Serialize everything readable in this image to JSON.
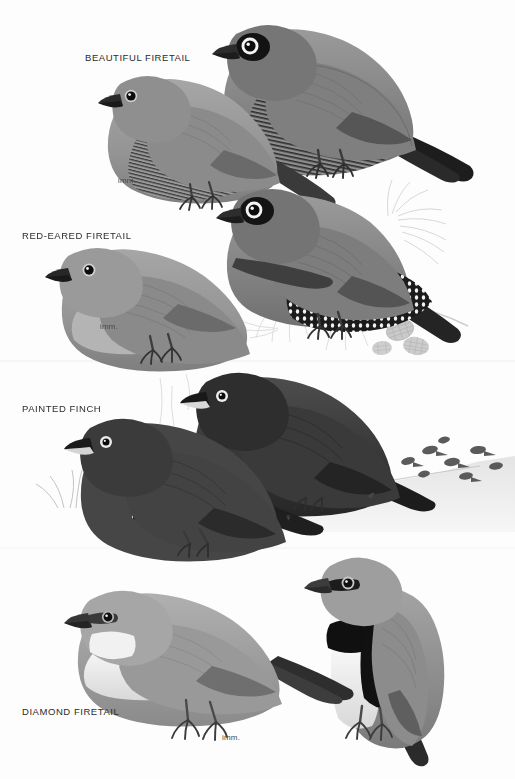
{
  "plate": {
    "title_visible": false,
    "background_color": "#fdfdfd",
    "style": "grayscale field-guide bird plate",
    "width": 515,
    "height": 779
  },
  "panels": [
    {
      "id": "beautiful-firetail",
      "label": "BEAUTIFUL FIRETAIL",
      "label_x": 85,
      "label_y": 52,
      "annotations": [
        {
          "kind": "imm",
          "text": "imm.",
          "x": 118,
          "y": 176
        }
      ],
      "birds": [
        {
          "role": "adult",
          "x": 225,
          "y": 22,
          "scale": 1.0,
          "facing": "left",
          "body_color": "#8d8d8d",
          "head_color": "#7d7d7d",
          "mask_color": "#141414",
          "eyering_color": "#f2f2f2",
          "tail_color": "#1f1f1f",
          "bill_color": "#2b2b2b",
          "barring": true,
          "spots": false
        },
        {
          "role": "immature",
          "x": 85,
          "y": 80,
          "scale": 0.82,
          "facing": "left",
          "body_color": "#9a9a9a",
          "head_color": "#8f8f8f",
          "mask_color": "#2f2f2f",
          "eyering_color": "#cfcfcf",
          "tail_color": "#3a3a3a",
          "bill_color": "#262626",
          "barring": true,
          "spots": false
        }
      ]
    },
    {
      "id": "red-eared-firetail",
      "label": "RED-EARED FIRETAIL",
      "label_x": 22,
      "label_y": 230,
      "annotations": [
        {
          "kind": "imm",
          "text": "imm.",
          "x": 100,
          "y": 322
        }
      ],
      "birds": [
        {
          "role": "adult",
          "x": 228,
          "y": 192,
          "scale": 0.98,
          "facing": "left",
          "body_color": "#8a8a8a",
          "head_color": "#7a7a7a",
          "mask_color": "#151515",
          "eyering_color": "#f4f4f4",
          "tail_color": "#232323",
          "bill_color": "#2b2b2b",
          "barring": true,
          "spots": false
        },
        {
          "role": "immature",
          "x": 60,
          "y": 248,
          "scale": 0.9,
          "facing": "left",
          "body_color": "#9b9b9b",
          "head_color": "#979797",
          "mask_color": "#3d3d3d",
          "eyering_color": "#d2d2d2",
          "tail_color": "#3f3f3f",
          "bill_color": "#242424",
          "barring": true,
          "spots": false
        }
      ],
      "habitat": "casuarina branch with cones and needles"
    },
    {
      "id": "painted-finch",
      "label": "PAINTED FINCH",
      "label_x": 22,
      "label_y": 403,
      "annotations": [
        {
          "kind": "male",
          "text": "♂",
          "x": 367,
          "y": 490
        },
        {
          "kind": "female",
          "text": "♀",
          "x": 284,
          "y": 512
        }
      ],
      "birds": [
        {
          "role": "male",
          "x": 200,
          "y": 372,
          "scale": 1.0,
          "facing": "left",
          "body_color": "#3f3f3f",
          "head_color": "#2e2e2e",
          "mask_color": "#1a1a1a",
          "eyering_color": "#ededed",
          "tail_color": "#1b1b1b",
          "bill_color": "#1c1c1c",
          "barring": false,
          "spots": true
        },
        {
          "role": "female",
          "x": 80,
          "y": 410,
          "scale": 0.95,
          "facing": "left",
          "body_color": "#4a4a4a",
          "head_color": "#3a3a3a",
          "mask_color": "#252525",
          "eyering_color": "#e8e8e8",
          "tail_color": "#1f1f1f",
          "bill_color": "#1f1f1f",
          "barring": false,
          "spots": true
        }
      ],
      "habitat": "spinifex tussocks, sandy ground, distant flock"
    },
    {
      "id": "diamond-firetail",
      "label": "DIAMOND FIRETAIL",
      "label_x": 22,
      "label_y": 706,
      "annotations": [
        {
          "kind": "imm",
          "text": "imm.",
          "x": 222,
          "y": 733
        }
      ],
      "birds": [
        {
          "role": "adult",
          "x": 300,
          "y": 556,
          "scale": 1.0,
          "facing": "left",
          "body_color": "#8e8e8e",
          "head_color": "#9c9c9c",
          "throat_color": "#f4f4f4",
          "breast_band_color": "#111111",
          "flank_color": "#111111",
          "spot_color": "#ffffff",
          "mask_color": "#1a1a1a",
          "eyering_color": "#c8c8c8",
          "tail_color": "#2a2a2a",
          "bill_color": "#3a3a3a",
          "barring": false,
          "spots": true
        },
        {
          "role": "immature",
          "x": 60,
          "y": 608,
          "scale": 1.0,
          "facing": "left",
          "body_color": "#9f9f9f",
          "head_color": "#a6a6a6",
          "throat_color": "#f0f0f0",
          "breast_band_color": "#8a8a8a",
          "flank_color": "#9a9a9a",
          "spot_color": "#e0e0e0",
          "mask_color": "#3a3a3a",
          "eyering_color": "#b8b8b8",
          "tail_color": "#2e2e2e",
          "bill_color": "#333333",
          "barring": false,
          "spots": false
        }
      ]
    }
  ],
  "dividers": [
    {
      "y": 361
    },
    {
      "y": 548
    }
  ]
}
